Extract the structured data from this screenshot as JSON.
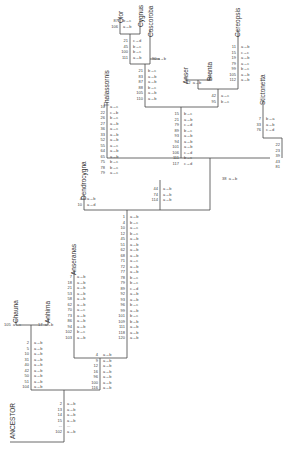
{
  "taxa": {
    "olor": "Olor",
    "cygnus": "Cygnus",
    "coscoroba": "Coscoroba",
    "anser": "Anser",
    "branta": "Branta",
    "cereopsis": "Cereopsis",
    "thalassornis": "Thalassornis",
    "stictonetta": "Stictonetta",
    "dendrocygna": "Dendrocygna",
    "anseranas": "Anseranas",
    "chauna": "Chauna",
    "anhima": "Anhima",
    "ancestor": "ANCESTOR"
  },
  "branches": {
    "olor": {
      "nums": [
        "87",
        "106"
      ],
      "chg": [
        "b→c",
        "a→b"
      ]
    },
    "cygnus": {
      "nums": [
        "21",
        "45",
        "100",
        "111"
      ],
      "chg": [
        "c→d",
        "b→c",
        "b→c",
        "a→b"
      ]
    },
    "coscoroba": {
      "nums": [
        "90"
      ],
      "chg": [
        "a→b"
      ]
    },
    "swans": {
      "nums": [
        "21",
        "83",
        "87",
        "88",
        "105",
        "110"
      ],
      "chg": [
        "b→c",
        "a→b",
        "a→b",
        "b→c",
        "a→b",
        "a→b"
      ]
    },
    "branta": {
      "nums": [
        "42"
      ],
      "chg": [
        "a→b"
      ]
    },
    "geese": {
      "nums": [
        "42",
        "95"
      ],
      "chg": [
        "a→c",
        "b→c"
      ]
    },
    "cereopsis": {
      "nums": [
        "11",
        "15",
        "19",
        "79",
        "99",
        "105",
        "112"
      ],
      "chg": [
        "a→b",
        "c→c",
        "a→b",
        "a→c",
        "b→c",
        "a→b",
        "a→b"
      ]
    },
    "anserinae": {
      "nums": [
        "15",
        "21",
        "79",
        "89",
        "93",
        "94",
        "101",
        "106",
        "111",
        "117"
      ],
      "chg": [
        "b→c",
        "a→b",
        "c→d",
        "b→c",
        "a→b",
        "a→b",
        "a→b",
        "c→d",
        "b→c",
        "c→d"
      ]
    },
    "thalassornis": {
      "nums": [
        "10",
        "22",
        "26",
        "27",
        "36",
        "33",
        "52",
        "55",
        "64",
        "65",
        "75",
        "78",
        "79"
      ],
      "chg": [
        "a→c",
        "c→b",
        "b→c",
        "a→b",
        "a→c",
        "a→b",
        "a→b",
        "a→c",
        "a→b",
        "a→b",
        "b→c",
        "b→c",
        "a→c"
      ]
    },
    "stictonetta": {
      "nums": [
        "7",
        "33",
        "76"
      ],
      "chg": [
        "b→a",
        "a→b",
        "c→d"
      ]
    },
    "stict_base": {
      "nums": [
        "22",
        "23",
        "39",
        "43",
        "81"
      ],
      "chg": [
        "",
        "",
        "",
        "",
        ""
      ]
    },
    "stict_join": {
      "nums": [
        "38"
      ],
      "chg": [
        "a→b"
      ]
    },
    "dendro_join": {
      "nums": [
        "44",
        "74",
        "114"
      ],
      "chg": [
        "a→b",
        "a→b",
        "a→b"
      ]
    },
    "dendrocygna": {
      "nums": [
        "4",
        "10"
      ],
      "chg": [
        "a→b",
        "a→d"
      ]
    },
    "anatidae": {
      "nums": [
        "1",
        "4",
        "10",
        "12",
        "45",
        "51",
        "62",
        "68",
        "71",
        "72",
        "77",
        "78",
        "79",
        "89",
        "92",
        "93",
        "96",
        "99",
        "101",
        "109",
        "111",
        "118",
        "120"
      ],
      "chg": [
        "a→b",
        "b→c",
        "a→c",
        "b→c",
        "a→b",
        "a→b",
        "a→b",
        "a→b",
        "a→c",
        "a→b",
        "a→b",
        "b→c",
        "b→c",
        "c→d",
        "a→b",
        "a→b",
        "b→c",
        "a→b",
        "b→c",
        "b→b",
        "a→b",
        "a→b",
        "a→b"
      ]
    },
    "anseranas": {
      "nums": [
        "7",
        "18",
        "21",
        "53",
        "58",
        "62",
        "70",
        "73",
        "86",
        "94",
        "102",
        "103"
      ],
      "chg": [
        "a→b",
        "a→b",
        "a→b",
        "a→b",
        "a→b",
        "a→b",
        "a→c",
        "a→b",
        "a→b",
        "a→b",
        "b→c",
        "a→b"
      ]
    },
    "anseriformes": {
      "nums": [
        "4",
        "9",
        "12",
        "16",
        "96",
        "100",
        "116"
      ],
      "chg": [
        "a→b",
        "a→b",
        "a→b",
        "a→b",
        "a→b",
        "a→b",
        "a→b"
      ]
    },
    "chauna": {
      "nums": [
        "105"
      ],
      "chg": [
        "a→c"
      ]
    },
    "anhima": {
      "nums": [
        "17"
      ],
      "chg": [
        "a→b"
      ]
    },
    "anhimidae": {
      "nums": [
        "2",
        "5",
        "10",
        "31",
        "40",
        "42",
        "50",
        "51",
        "104"
      ],
      "chg": [
        "a→b",
        "a→b",
        "a→b",
        "a→b",
        "a→b",
        "a→b",
        "a→b",
        "a→b",
        "a→b"
      ]
    },
    "root": {
      "nums": [
        "2",
        "13",
        "14",
        "15",
        "...",
        "102"
      ],
      "chg": [
        "a→b",
        "a→b",
        "a→b",
        "a→b",
        "...",
        "a→b"
      ]
    }
  }
}
